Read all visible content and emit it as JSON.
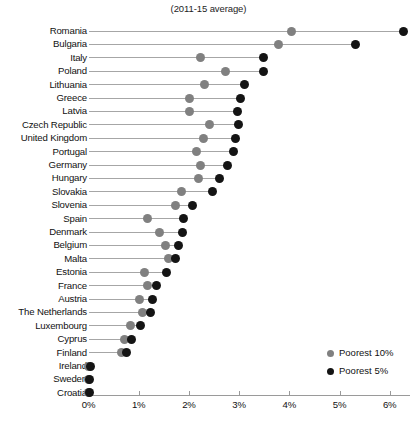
{
  "chart_data": {
    "type": "scatter",
    "title": "(2011-15 average)",
    "subtitle": "",
    "xlabel": "",
    "ylabel": "",
    "xlim": [
      0,
      6.55
    ],
    "grid": false,
    "legend_position": "bottom-right",
    "xticks": [
      0,
      1,
      2,
      3,
      4,
      5,
      6
    ],
    "xtick_labels": [
      "0%",
      "1%",
      "2%",
      "3%",
      "4%",
      "5%",
      "6%"
    ],
    "legend": [
      {
        "name": "Poorest 10%",
        "color": "#808080"
      },
      {
        "name": "Poorest 5%",
        "color": "#141414"
      }
    ],
    "categories": [
      "Romania",
      "Bulgaria",
      "Italy",
      "Poland",
      "Lithuania",
      "Greece",
      "Latvia",
      "Czech Republic",
      "United Kingdom",
      "Portugal",
      "Germany",
      "Hungary",
      "Slovakia",
      "Slovenia",
      "Spain",
      "Denmark",
      "Belgium",
      "Malta",
      "Estonia",
      "France",
      "Austria",
      "The Netherlands",
      "Luxembourg",
      "Cyprus",
      "Finland",
      "Ireland",
      "Sweden",
      "Croatia"
    ],
    "series": [
      {
        "name": "Poorest 10%",
        "color": "#808080",
        "values": [
          4.05,
          3.78,
          2.23,
          2.73,
          2.31,
          2.01,
          2.01,
          2.41,
          2.29,
          2.15,
          2.23,
          2.19,
          1.85,
          1.73,
          1.18,
          1.41,
          1.53,
          1.59,
          1.12,
          1.18,
          1.02,
          1.08,
          0.84,
          0.72,
          0.66,
          0.0,
          0.0,
          0.0
        ]
      },
      {
        "name": "Poorest 5%",
        "color": "#141414",
        "values": [
          6.27,
          5.32,
          3.49,
          3.49,
          3.11,
          3.03,
          2.97,
          2.99,
          2.93,
          2.89,
          2.77,
          2.61,
          2.47,
          2.07,
          1.89,
          1.87,
          1.79,
          1.73,
          1.55,
          1.35,
          1.27,
          1.23,
          1.03,
          0.86,
          0.76,
          0.04,
          0.02,
          0.02
        ]
      }
    ]
  }
}
